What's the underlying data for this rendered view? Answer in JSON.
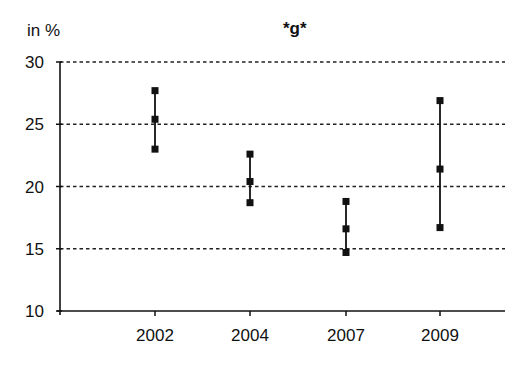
{
  "chart_data": {
    "type": "scatter",
    "subtype": "range-plot (low / mid / high markers joined by vertical line)",
    "title": "*g*",
    "ylabel": "in %",
    "xlabel": "",
    "categories": [
      "2002",
      "2004",
      "2007",
      "2009"
    ],
    "series": [
      {
        "name": "high",
        "values": [
          27.7,
          22.6,
          18.8,
          26.9
        ]
      },
      {
        "name": "mid",
        "values": [
          25.4,
          20.4,
          16.6,
          21.4
        ]
      },
      {
        "name": "low",
        "values": [
          23.0,
          18.7,
          14.7,
          16.7
        ]
      }
    ],
    "ylim": [
      10,
      30
    ],
    "yticks": [
      10,
      15,
      20,
      25,
      30
    ],
    "grid": {
      "y": true,
      "style": "dashed",
      "lines_at": [
        15,
        20,
        25,
        30
      ]
    },
    "legend": "none",
    "colors": {
      "marker": "#111111",
      "line": "#111111",
      "grid": "#222222",
      "axis": "#111111"
    }
  }
}
